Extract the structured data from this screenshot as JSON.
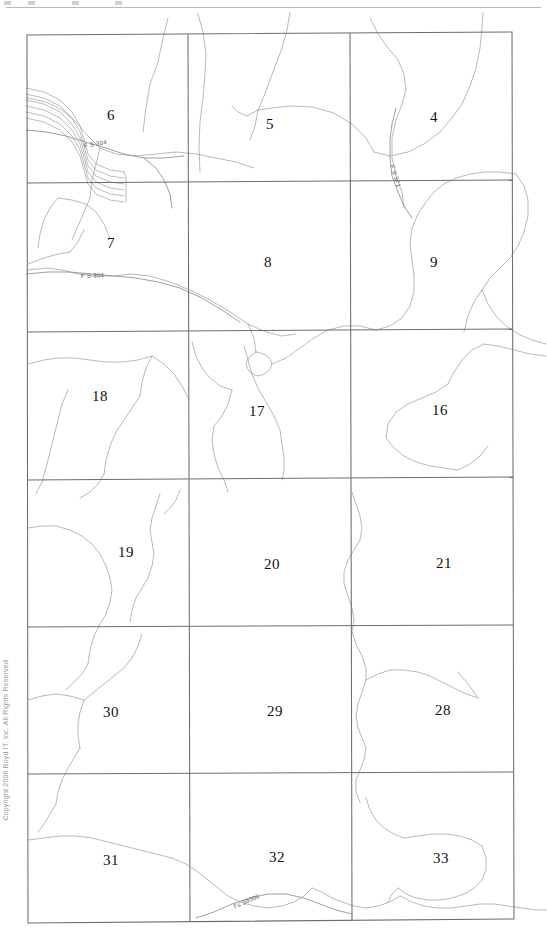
{
  "document": {
    "type": "township-section-map",
    "copyright": "Copyright 2006 Boyd IT, Inc. All Rights Reserved"
  },
  "map": {
    "grid": {
      "columns": 3,
      "rows": 6,
      "border_color": "#6d6d6d",
      "line_color": "#6d6d6d"
    },
    "feature_color": "#9a9a9a",
    "sections": [
      {
        "number": "6",
        "col": 0,
        "row": 0,
        "x": 111,
        "y": 103
      },
      {
        "number": "5",
        "col": 1,
        "row": 0,
        "x": 270,
        "y": 112
      },
      {
        "number": "4",
        "col": 2,
        "row": 0,
        "x": 434,
        "y": 105
      },
      {
        "number": "7",
        "col": 0,
        "row": 1,
        "x": 111,
        "y": 231
      },
      {
        "number": "8",
        "col": 1,
        "row": 1,
        "x": 268,
        "y": 250
      },
      {
        "number": "9",
        "col": 2,
        "row": 1,
        "x": 434,
        "y": 250
      },
      {
        "number": "18",
        "col": 0,
        "row": 2,
        "x": 100,
        "y": 384
      },
      {
        "number": "17",
        "col": 1,
        "row": 2,
        "x": 257,
        "y": 399
      },
      {
        "number": "16",
        "col": 2,
        "row": 2,
        "x": 440,
        "y": 398
      },
      {
        "number": "19",
        "col": 0,
        "row": 3,
        "x": 126,
        "y": 540
      },
      {
        "number": "20",
        "col": 1,
        "row": 3,
        "x": 272,
        "y": 552
      },
      {
        "number": "21",
        "col": 2,
        "row": 3,
        "x": 444,
        "y": 551
      },
      {
        "number": "30",
        "col": 0,
        "row": 4,
        "x": 111,
        "y": 700
      },
      {
        "number": "29",
        "col": 1,
        "row": 4,
        "x": 275,
        "y": 699
      },
      {
        "number": "28",
        "col": 2,
        "row": 4,
        "x": 443,
        "y": 698
      },
      {
        "number": "31",
        "col": 0,
        "row": 5,
        "x": 111,
        "y": 848
      },
      {
        "number": "32",
        "col": 1,
        "row": 5,
        "x": 277,
        "y": 845
      },
      {
        "number": "33",
        "col": 2,
        "row": 5,
        "x": 441,
        "y": 846
      }
    ],
    "road_labels": [
      {
        "text": "F S 304",
        "x": 84,
        "y": 131,
        "rotate": -10
      },
      {
        "text": "F S 304",
        "x": 81,
        "y": 261,
        "rotate": -2
      },
      {
        "text": "F S 371",
        "x": 392,
        "y": 150,
        "rotate": 72
      },
      {
        "text": "Fs 39000",
        "x": 234,
        "y": 892,
        "rotate": -24
      }
    ]
  }
}
